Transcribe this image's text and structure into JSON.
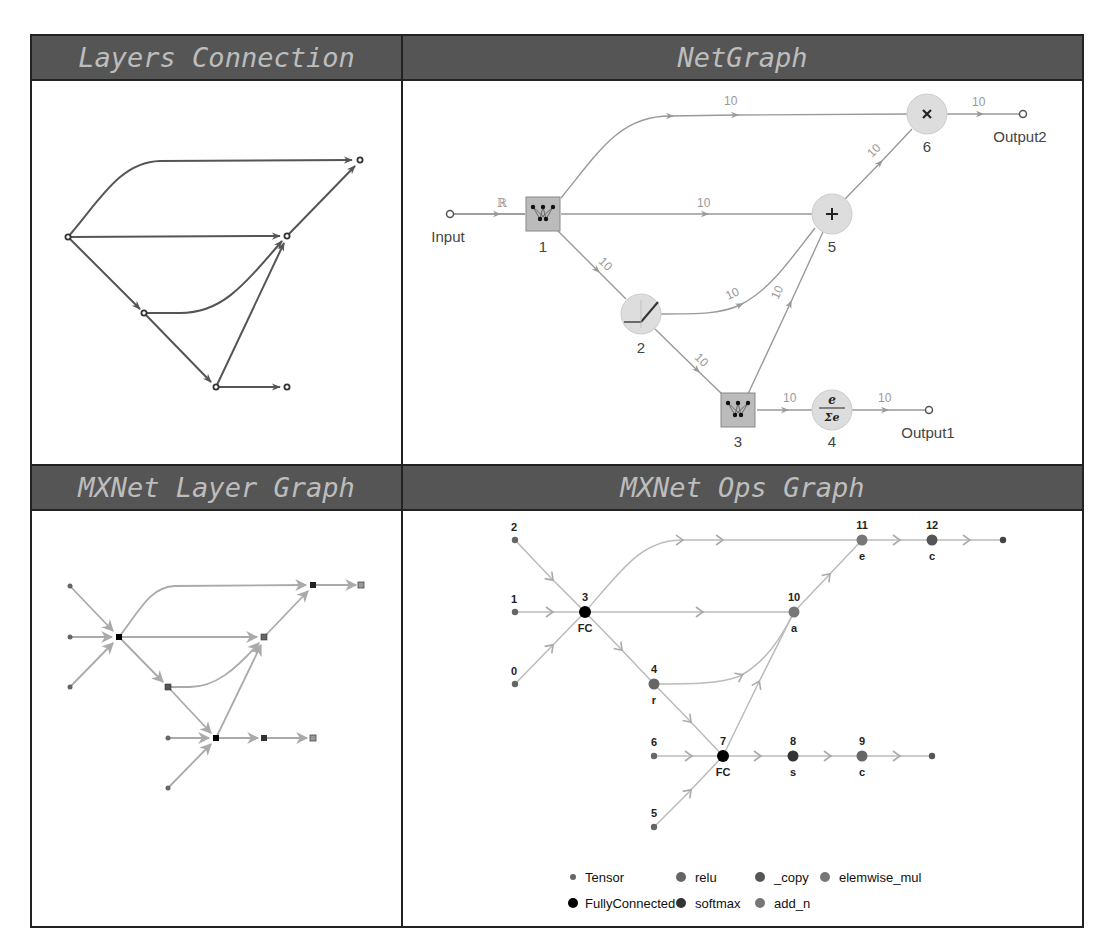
{
  "panels": {
    "layers_connection": {
      "title": "Layers Connection",
      "nodes": [
        {
          "id": "a",
          "x": 68,
          "y": 237
        },
        {
          "id": "b",
          "x": 287,
          "y": 236
        },
        {
          "id": "c",
          "x": 360,
          "y": 160
        },
        {
          "id": "d",
          "x": 144,
          "y": 313
        },
        {
          "id": "e",
          "x": 216,
          "y": 387
        },
        {
          "id": "f",
          "x": 287,
          "y": 387
        }
      ]
    },
    "netgraph": {
      "title": "NetGraph",
      "input_label": "Input",
      "input_type": "ℝ",
      "output1_label": "Output1",
      "output2_label": "Output2",
      "nodes": [
        {
          "id": "1",
          "type": "linear",
          "x": 543,
          "y": 214
        },
        {
          "id": "2",
          "type": "ramp",
          "x": 641,
          "y": 314
        },
        {
          "id": "3",
          "type": "linear",
          "x": 738,
          "y": 410
        },
        {
          "id": "4",
          "type": "softmax",
          "x": 832,
          "y": 410
        },
        {
          "id": "5",
          "type": "plus",
          "x": 832,
          "y": 214
        },
        {
          "id": "6",
          "type": "times",
          "x": 927,
          "y": 114
        }
      ],
      "edge_dims": [
        "10",
        "10",
        "10",
        "10",
        "10",
        "10",
        "10",
        "10",
        "10"
      ],
      "softmax_num": "e",
      "softmax_den": "Σe"
    },
    "mxnet_layer_graph": {
      "title": "MXNet Layer Graph"
    },
    "mxnet_ops_graph": {
      "title": "MXNet Ops Graph",
      "nodes": [
        {
          "id": "0",
          "label": "",
          "type": "Tensor"
        },
        {
          "id": "1",
          "label": "",
          "type": "Tensor"
        },
        {
          "id": "2",
          "label": "",
          "type": "Tensor"
        },
        {
          "id": "3",
          "label": "FC",
          "type": "FullyConnected"
        },
        {
          "id": "4",
          "label": "r",
          "type": "relu"
        },
        {
          "id": "5",
          "label": "",
          "type": "Tensor"
        },
        {
          "id": "6",
          "label": "",
          "type": "Tensor"
        },
        {
          "id": "7",
          "label": "FC",
          "type": "FullyConnected"
        },
        {
          "id": "8",
          "label": "s",
          "type": "softmax"
        },
        {
          "id": "9",
          "label": "c",
          "type": "_copy"
        },
        {
          "id": "10",
          "label": "a",
          "type": "add_n"
        },
        {
          "id": "11",
          "label": "e",
          "type": "elemwise_mul"
        },
        {
          "id": "12",
          "label": "c",
          "type": "_copy"
        }
      ],
      "legend": [
        {
          "label": "Tensor",
          "color": "#666666",
          "size": "small"
        },
        {
          "label": "relu",
          "color": "#666666"
        },
        {
          "label": "_copy",
          "color": "#555555"
        },
        {
          "label": "elemwise_mul",
          "color": "#777777"
        },
        {
          "label": "FullyConnected",
          "color": "#000000"
        },
        {
          "label": "softmax",
          "color": "#333333"
        },
        {
          "label": "add_n",
          "color": "#777777"
        }
      ]
    }
  }
}
